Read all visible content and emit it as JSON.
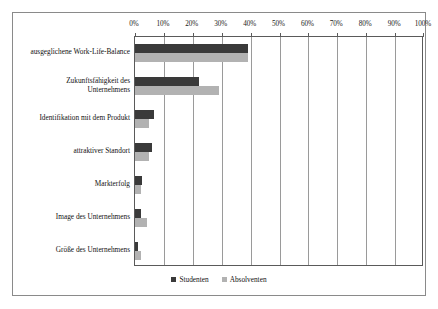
{
  "chart_data": {
    "type": "bar",
    "orientation": "horizontal",
    "title": "",
    "xlabel": "",
    "ylabel": "",
    "xlim": [
      0,
      100
    ],
    "grid": true,
    "legend_position": "bottom",
    "tick_labels": [
      "0%",
      "10%",
      "20%",
      "30%",
      "40%",
      "50%",
      "60%",
      "70%",
      "80%",
      "90%",
      "100%"
    ],
    "tick_values": [
      0,
      10,
      20,
      30,
      40,
      50,
      60,
      70,
      80,
      90,
      100
    ],
    "categories": [
      "ausgeglichene Work-Life-Balance",
      "Zukunftsfähigkeit des Unternehmens",
      "Identifikation mit dem Produkt",
      "attraktiver Standort",
      "Markterfolg",
      "Image des Unternehmens",
      "Größe des Unternehmens"
    ],
    "series": [
      {
        "name": "Studenten",
        "color": "#3a3a3a",
        "values": [
          39,
          22,
          6.5,
          6,
          2.5,
          2,
          1
        ]
      },
      {
        "name": "Absolventen",
        "color": "#b2b2b2",
        "values": [
          39,
          29,
          5,
          5,
          2,
          4,
          2
        ]
      }
    ]
  },
  "legend": {
    "entries": [
      {
        "label": "Studenten"
      },
      {
        "label": "Absolventen"
      }
    ]
  }
}
